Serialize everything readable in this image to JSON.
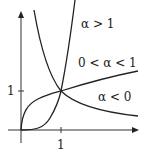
{
  "diagram": {
    "axes": {
      "x_tick_label": "1",
      "y_tick_label": "1"
    },
    "curves": [
      {
        "name": "alpha-greater-than-1",
        "label": "α > 1"
      },
      {
        "name": "alpha-between-0-and-1",
        "label": "0 < α < 1"
      },
      {
        "name": "alpha-less-than-0",
        "label": "α < 0"
      }
    ],
    "colors": {
      "stroke": "#222222",
      "background": "#ffffff"
    }
  }
}
